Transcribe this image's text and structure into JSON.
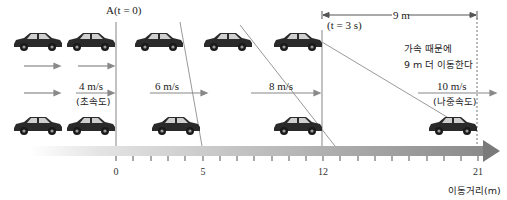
{
  "diagram": {
    "title_marker_start": "A(t = 0)",
    "title_marker_end": "(t = 3 s)",
    "distance_span_label": "9 m",
    "note_line1": "가속 때문에",
    "note_line2": "9 m 더 이동한다",
    "velocities": [
      {
        "value": "4 m/s",
        "caption": "(초속도)"
      },
      {
        "value": "6 m/s",
        "caption": ""
      },
      {
        "value": "8 m/s",
        "caption": ""
      },
      {
        "value": "10 m/s",
        "caption": "(나중속도)"
      }
    ],
    "axis": {
      "ticks_labeled": [
        "0",
        "5",
        "12",
        "21"
      ],
      "tick_positions_m": [
        0,
        5,
        12,
        21
      ],
      "min": 0,
      "max": 21,
      "label": "이동거리(m)"
    },
    "colors": {
      "car": "#2a2a2a",
      "line": "#888888",
      "arrow_gradient_start": "#f2f2f2",
      "arrow_gradient_end": "#7a7a7a"
    }
  }
}
